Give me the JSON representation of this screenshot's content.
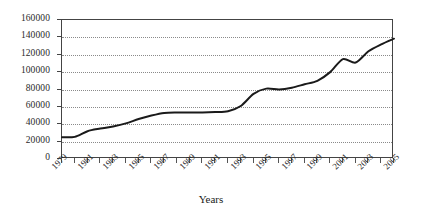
{
  "chart_data": {
    "type": "line",
    "title": "",
    "xlabel": "Years",
    "ylabel": "",
    "xlim": [
      1979,
      2005
    ],
    "ylim": [
      0,
      160000
    ],
    "grid": true,
    "legend": false,
    "y_ticks": [
      160000,
      140000,
      120000,
      100000,
      80000,
      60000,
      40000,
      20000,
      0
    ],
    "y_tick_labels": [
      "160000",
      "140000",
      "120000",
      "100000",
      "80000",
      "60000",
      "40000",
      "20000",
      "0"
    ],
    "x_ticks": [
      1979,
      1980,
      1981,
      1982,
      1983,
      1984,
      1985,
      1986,
      1987,
      1988,
      1989,
      1990,
      1991,
      1992,
      1993,
      1994,
      1995,
      1996,
      1997,
      1998,
      1999,
      2000,
      2001,
      2002,
      2003,
      2004,
      2005
    ],
    "x_tick_labels": [
      "1979",
      "",
      "1981",
      "",
      "1983",
      "",
      "1985",
      "",
      "1987",
      "",
      "1989",
      "",
      "1991",
      "",
      "1993",
      "",
      "1995",
      "",
      "1997",
      "",
      "1999",
      "",
      "2001",
      "",
      "2003",
      "",
      "2005"
    ],
    "x": [
      1979,
      1980,
      1981,
      1982,
      1983,
      1984,
      1985,
      1986,
      1987,
      1988,
      1989,
      1990,
      1991,
      1992,
      1993,
      1994,
      1995,
      1996,
      1997,
      1998,
      1999,
      2000,
      2001,
      2002,
      2003,
      2004,
      2005
    ],
    "values": [
      25000,
      25500,
      32000,
      35000,
      37500,
      41000,
      46000,
      50000,
      53000,
      53500,
      53500,
      53500,
      54000,
      55000,
      61000,
      75000,
      81000,
      80000,
      82000,
      86000,
      90000,
      100000,
      115000,
      111000,
      124000,
      132000,
      138500
    ],
    "series": [
      {
        "name": "series-1",
        "color": "#1a1a1a",
        "line_width": 2,
        "values": [
          25000,
          25500,
          32000,
          35000,
          37500,
          41000,
          46000,
          50000,
          53000,
          53500,
          53500,
          53500,
          54000,
          55000,
          61000,
          75000,
          81000,
          80000,
          82000,
          86000,
          90000,
          100000,
          115000,
          111000,
          124000,
          132000,
          138500
        ]
      }
    ]
  },
  "colors": {
    "line": "#1a1a1a",
    "axis": "#444444",
    "grid": "#8a8a8a",
    "background": "#ffffff",
    "text": "#1a1a1a"
  }
}
